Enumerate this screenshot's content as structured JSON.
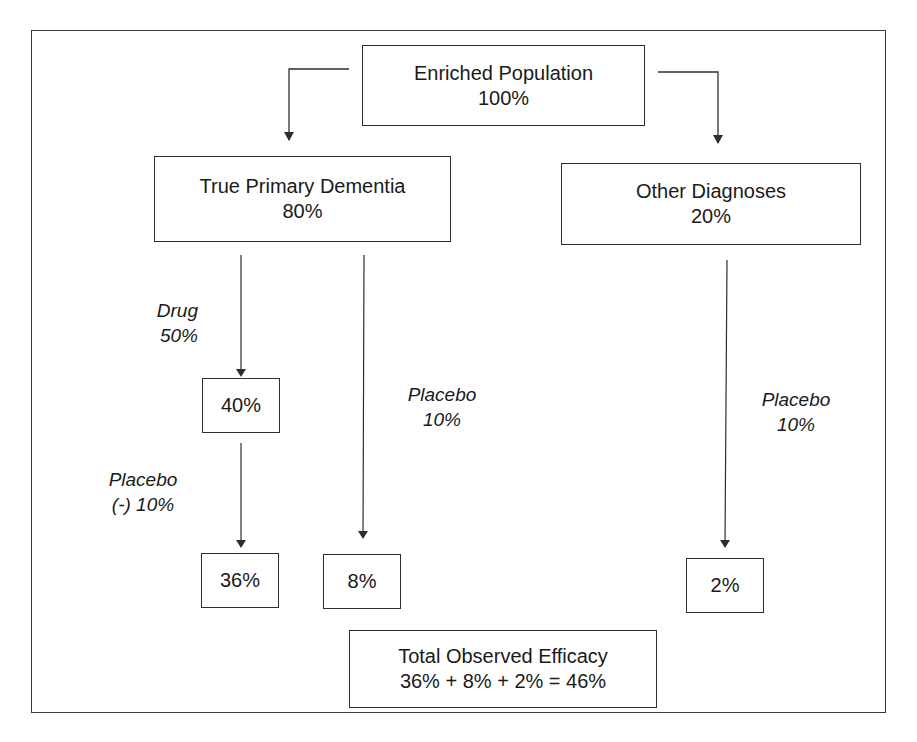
{
  "diagram": {
    "root": {
      "title": "Enriched Population",
      "value": "100%"
    },
    "branches": {
      "true_primary_dementia": {
        "title": "True Primary Dementia",
        "value": "80%"
      },
      "other_diagnoses": {
        "title": "Other Diagnoses",
        "value": "20%"
      }
    },
    "edge_labels": {
      "drug": {
        "line1": "Drug",
        "line2": "50%"
      },
      "placebo_negative": {
        "line1": "Placebo",
        "line2": "(-) 10%"
      },
      "placebo_tpd": {
        "line1": "Placebo",
        "line2": "10%"
      },
      "placebo_other": {
        "line1": "Placebo",
        "line2": "10%"
      }
    },
    "nodes": {
      "drug_result": "40%",
      "drug_minus_placebo": "36%",
      "placebo_tpd_result": "8%",
      "placebo_other_result": "2%"
    },
    "total": {
      "title": "Total Observed Efficacy",
      "equation": "36% + 8% + 2% = 46%"
    },
    "colors": {
      "line": "#2e2e2e",
      "text": "#1a1a1a",
      "background": "#ffffff"
    }
  }
}
